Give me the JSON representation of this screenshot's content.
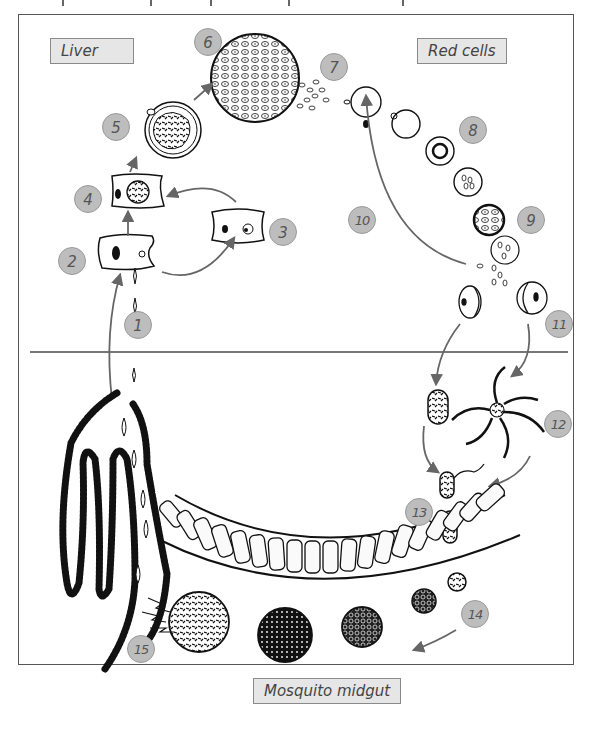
{
  "diagram": {
    "regions": {
      "liver": "Liver",
      "red_cells": "Red cells",
      "mosquito_midgut": "Mosquito midgut"
    },
    "steps": [
      {
        "n": "1",
        "x": 124,
        "y": 311
      },
      {
        "n": "2",
        "x": 58,
        "y": 247
      },
      {
        "n": "3",
        "x": 269,
        "y": 218
      },
      {
        "n": "4",
        "x": 74,
        "y": 185
      },
      {
        "n": "5",
        "x": 102,
        "y": 113
      },
      {
        "n": "6",
        "x": 194,
        "y": 28
      },
      {
        "n": "7",
        "x": 320,
        "y": 53
      },
      {
        "n": "8",
        "x": 459,
        "y": 116
      },
      {
        "n": "9",
        "x": 517,
        "y": 206
      },
      {
        "n": "10",
        "x": 348,
        "y": 206
      },
      {
        "n": "11",
        "x": 545,
        "y": 310
      },
      {
        "n": "12",
        "x": 544,
        "y": 410
      },
      {
        "n": "13",
        "x": 405,
        "y": 498
      },
      {
        "n": "14",
        "x": 461,
        "y": 600
      },
      {
        "n": "15",
        "x": 127,
        "y": 635
      }
    ],
    "divider": "host / mosquito boundary",
    "colors": {
      "frame": "#555555",
      "label_bg": "#e6e6e6",
      "label_border": "#8a8a8a",
      "badge_bg": "#bdbdbd",
      "arrow": "#666666",
      "ink": "#111111"
    }
  }
}
